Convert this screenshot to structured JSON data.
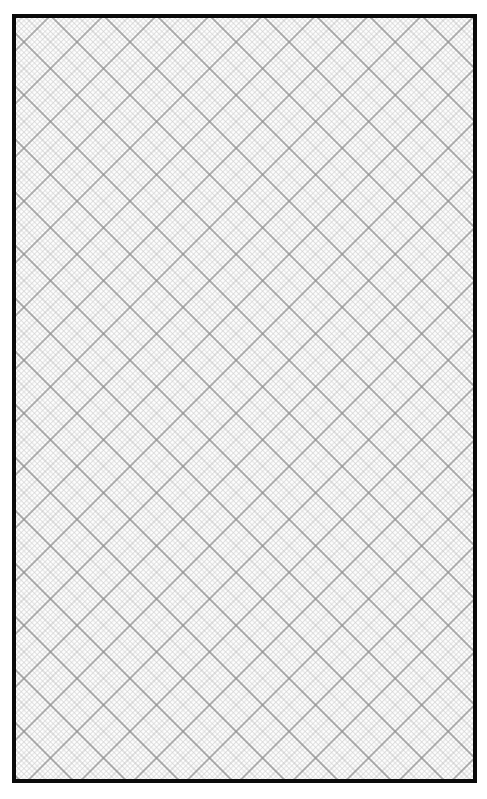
{
  "sheet": {
    "type": "diagonal-graph-paper",
    "orientation_degrees": 45,
    "frame": {
      "border_color": "#0a0a0a",
      "border_width": 4
    },
    "grid": {
      "major_spacing_px": 37.5,
      "minor_subdivisions": 10,
      "major_color": "#8f8f8f",
      "medium_color": "#b5b5b5",
      "minor_color": "#cfcfcf",
      "background_color": "#ffffff"
    }
  }
}
